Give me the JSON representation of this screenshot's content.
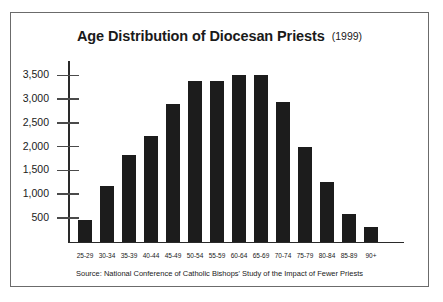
{
  "figure": {
    "title": "Age Distribution of Diocesan Priests",
    "year": "(1999)",
    "source": "Source: National Conference of Catholic Bishops' Study of the Impact of Fewer Priests",
    "border_color": "#6b6b6b",
    "bar_color": "#1c1c1c",
    "axis_color": "#2a2a2a"
  },
  "chart_data": {
    "type": "bar",
    "subtitle": "",
    "xlabel": "",
    "ylabel": "",
    "categories": [
      "25-29",
      "30-34",
      "35-39",
      "40-44",
      "45-49",
      "50-54",
      "55-59",
      "60-64",
      "65-69",
      "70-74",
      "75-79",
      "80-84",
      "85-89",
      "90+"
    ],
    "values": [
      450,
      1175,
      1825,
      2225,
      2890,
      3380,
      3375,
      3510,
      3500,
      2930,
      2000,
      1250,
      575,
      300
    ],
    "ylim": [
      0,
      3800
    ],
    "yticks": [
      500,
      1000,
      1500,
      2000,
      2500,
      3000,
      3500
    ],
    "ytick_labels": [
      "500",
      "1,000",
      "1,500",
      "2,000",
      "2,500",
      "3,000",
      "3,500"
    ],
    "grid": false,
    "legend": false,
    "annotations": [
      "Source: National Conference of Catholic Bishops' Study of the Impact of Fewer Priests"
    ]
  }
}
